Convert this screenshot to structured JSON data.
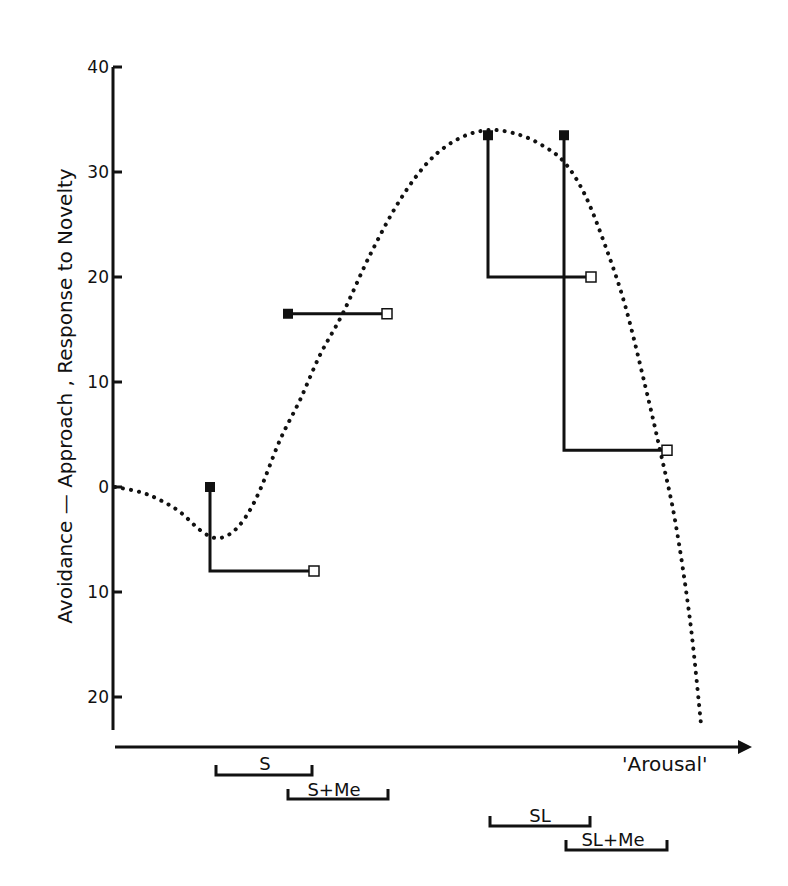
{
  "chart_data": {
    "type": "line",
    "title": "",
    "ylabel": "Avoidance — Approach , Response to Novelty",
    "xlabel": "'Arousal'",
    "ylim": [
      -22,
      40
    ],
    "y_ticks": [
      {
        "value": 40,
        "label": "40"
      },
      {
        "value": 30,
        "label": "30"
      },
      {
        "value": 20,
        "label": "20"
      },
      {
        "value": 10,
        "label": "10"
      },
      {
        "value": 0,
        "label": "0"
      },
      {
        "value": -10,
        "label": "10"
      },
      {
        "value": -20,
        "label": "20"
      }
    ],
    "grid": false,
    "curve": {
      "name": "inverted-U arousal curve (dotted)",
      "style": "dotted",
      "points_px": [
        [
          115,
          487
        ],
        [
          140,
          492
        ],
        [
          160,
          500
        ],
        [
          180,
          512
        ],
        [
          200,
          530
        ],
        [
          215,
          538
        ],
        [
          230,
          534
        ],
        [
          245,
          518
        ],
        [
          260,
          490
        ],
        [
          280,
          440
        ],
        [
          300,
          400
        ],
        [
          320,
          355
        ],
        [
          343,
          313
        ],
        [
          370,
          255
        ],
        [
          400,
          200
        ],
        [
          430,
          160
        ],
        [
          460,
          138
        ],
        [
          490,
          130
        ],
        [
          520,
          135
        ],
        [
          545,
          147
        ],
        [
          565,
          163
        ],
        [
          585,
          195
        ],
        [
          605,
          245
        ],
        [
          625,
          305
        ],
        [
          645,
          385
        ],
        [
          660,
          450
        ],
        [
          675,
          520
        ],
        [
          690,
          620
        ],
        [
          701,
          724
        ]
      ]
    },
    "series": [
      {
        "name": "S",
        "filled_value": 0,
        "open_value": -8,
        "filled_x": 210,
        "open_x": 314,
        "range": {
          "x1": 216,
          "x2": 312,
          "y": 775,
          "label_x": 265,
          "label_y": 770
        }
      },
      {
        "name": "S+Me",
        "filled_value": 16.5,
        "open_value": 16.5,
        "filled_x": 288,
        "open_x": 387,
        "range": {
          "x1": 288,
          "x2": 388,
          "y": 799,
          "label_x": 334,
          "label_y": 796
        }
      },
      {
        "name": "SL",
        "filled_value": 33.5,
        "open_value": 20,
        "filled_x": 488,
        "open_x": 591,
        "range": {
          "x1": 490,
          "x2": 590,
          "y": 826,
          "label_x": 540,
          "label_y": 822
        }
      },
      {
        "name": "SL+Me",
        "filled_value": 33.5,
        "open_value": 3.5,
        "filled_x": 564,
        "open_x": 667,
        "range": {
          "x1": 566,
          "x2": 667,
          "y": 850,
          "label_x": 613,
          "label_y": 846
        }
      }
    ],
    "legend": null
  },
  "layout": {
    "y_axis_x": 113,
    "y_axis_top": 67,
    "y_axis_bottom": 730,
    "x_axis_y": 747,
    "x_axis_start": 115,
    "x_axis_end": 752,
    "y0_px": 487,
    "px_per_unit": 10.5
  },
  "colors": {
    "ink": "#111111",
    "background": "#ffffff"
  }
}
